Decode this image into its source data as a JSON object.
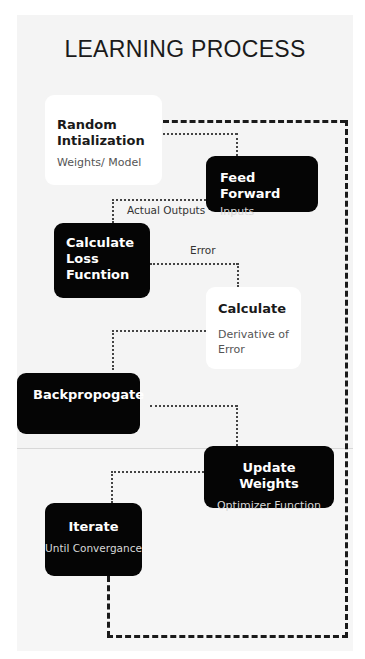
{
  "diagram": {
    "title": "LEARNING PROCESS",
    "nodes": [
      {
        "id": "random-init",
        "title": "Random Intialization",
        "subtitle": "Weights/ Model",
        "style": "light"
      },
      {
        "id": "feed-forward",
        "title": "Feed Forward",
        "subtitle": "Inputs",
        "style": "dark"
      },
      {
        "id": "calculate-loss",
        "title": "Calculate Loss Fucntion",
        "subtitle": "",
        "style": "dark"
      },
      {
        "id": "calculate",
        "title": "Calculate",
        "subtitle": "Derivative of Error",
        "style": "light"
      },
      {
        "id": "backpropogate",
        "title": "Backpropogate",
        "subtitle": "",
        "style": "dark"
      },
      {
        "id": "update-weights",
        "title": "Update Weights",
        "subtitle": "Optimizer Function",
        "style": "dark"
      },
      {
        "id": "iterate",
        "title": "Iterate",
        "subtitle": "Until Convergance",
        "style": "dark"
      }
    ],
    "edges": [
      {
        "from": "random-init",
        "to": "feed-forward",
        "label": "",
        "style": "dotted"
      },
      {
        "from": "feed-forward",
        "to": "calculate-loss",
        "label": "Actual Outputs",
        "style": "dotted"
      },
      {
        "from": "calculate-loss",
        "to": "calculate",
        "label": "Error",
        "style": "dotted"
      },
      {
        "from": "calculate",
        "to": "backpropogate",
        "label": "",
        "style": "dotted"
      },
      {
        "from": "backpropogate",
        "to": "update-weights",
        "label": "",
        "style": "dotted"
      },
      {
        "from": "update-weights",
        "to": "iterate",
        "label": "",
        "style": "dotted"
      },
      {
        "from": "iterate",
        "to": "random-init",
        "label": "",
        "style": "dashed-loop"
      }
    ],
    "colors": {
      "dark_node": "#050505",
      "light_node": "#ffffff",
      "panel": "#f4f4f4",
      "line": "#1a1a1a"
    }
  },
  "labels": {
    "title": "LEARNING PROCESS",
    "random_init_title_1": "Random",
    "random_init_title_2": "Intialization",
    "random_init_sub": "Weights/ Model",
    "feed_forward_title": "Feed Forward",
    "feed_forward_sub": "Inputs",
    "loss_title_1": "Calculate",
    "loss_title_2": "Loss",
    "loss_title_3": "Fucntion",
    "calculate_title": "Calculate",
    "calculate_sub_1": "Derivative of",
    "calculate_sub_2": "Error",
    "backprop_title": "Backpropogate",
    "update_title": "Update Weights",
    "update_sub": "Optimizer Function",
    "iterate_title": "Iterate",
    "iterate_sub": "Until Convergance",
    "edge_actual_outputs": "Actual Outputs",
    "edge_error": "Error"
  }
}
